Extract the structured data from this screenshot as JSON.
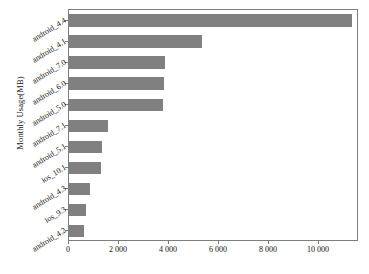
{
  "chart_data": {
    "type": "bar",
    "orientation": "horizontal",
    "title": "",
    "xlabel": "",
    "ylabel": "Monthly Usage(MB)",
    "categories": [
      "android_4.4",
      "android_4.1",
      "android_7.0",
      "android_6.0",
      "android_5.0",
      "android_7.1",
      "android_5.1",
      "ios_10.1",
      "android_4.3",
      "ios_9.3",
      "android_4.2"
    ],
    "values": [
      11320,
      5310,
      3840,
      3810,
      3760,
      1550,
      1330,
      1280,
      830,
      690,
      590
    ],
    "xlim": [
      0,
      11600
    ],
    "ylim": [
      0,
      11
    ],
    "xticks": [
      0,
      2000,
      4000,
      6000,
      8000,
      10000
    ],
    "xticklabels": [
      "0",
      "2 000",
      "4 000",
      "6 000",
      "8 000",
      "10 000"
    ],
    "grid": false,
    "legend": null,
    "bar_color": "#808080",
    "axis_color": "#7d7d7d",
    "background_color": "#ffffff"
  }
}
